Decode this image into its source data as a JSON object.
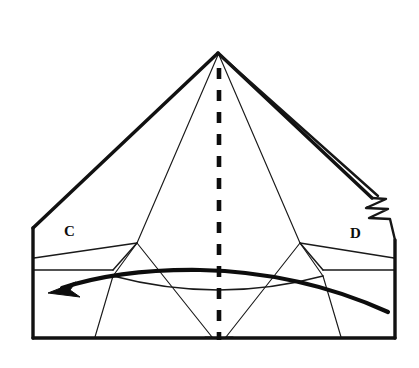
{
  "figure": {
    "kind": "origami-folding-diagram",
    "background_color": "#ffffff",
    "ink_color": "#0d0d0d",
    "width": 419,
    "height": 368
  },
  "labels": [
    {
      "name": "corner-label-c",
      "text": "C",
      "x": 66,
      "y": 234
    },
    {
      "name": "corner-label-d",
      "text": "D",
      "x": 352,
      "y": 236
    }
  ],
  "geometry": {
    "apex": {
      "x": 218,
      "y": 53
    },
    "left_shoulder": {
      "x": 33,
      "y": 228
    },
    "right_shoulder": {
      "x": 395,
      "y": 240
    },
    "bottom_left": {
      "x": 33,
      "y": 338
    },
    "bottom_right": {
      "x": 395,
      "y": 338
    },
    "left_vertex": {
      "x": 137,
      "y": 243
    },
    "right_vertex": {
      "x": 300,
      "y": 243
    },
    "center_line": {
      "x": 219,
      "y_top": 68,
      "y_bottom": 340
    }
  },
  "annotations": {
    "fold_line": {
      "name": "valley-fold-center-line",
      "style": "dashed",
      "description": "vertical dashed fold line down the centre"
    },
    "action_arrow": {
      "name": "fold-direction-arrow",
      "direction": "right-to-left",
      "description": "curved arrow sweeping leftwards across the lower band"
    },
    "edge_notch": {
      "name": "layer-notch-zigzag",
      "description": "stepped zigzag showing hidden paper layers on the right edge"
    }
  },
  "legend": {
    "dashed_meaning": "fold line",
    "arrow_meaning": "fold in direction of arrow"
  }
}
